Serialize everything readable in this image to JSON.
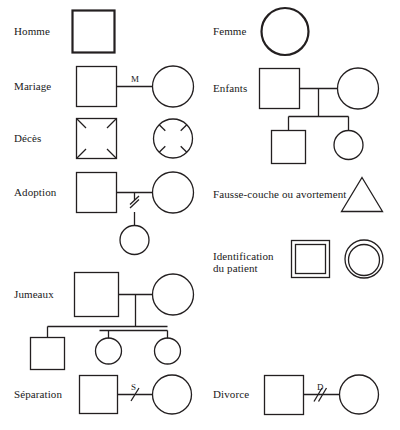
{
  "figure": {
    "kind": "genogram-legend",
    "language": "fr",
    "width": 400,
    "height": 430,
    "background_color": "#ffffff",
    "stroke_color": "#231f20",
    "text_color": "#1a1a1a"
  },
  "left_column": {
    "rows": [
      {
        "id": "homme",
        "label": "Homme",
        "symbols": [
          "square-bold"
        ]
      },
      {
        "id": "mariage",
        "label": "Mariage",
        "symbols": [
          "square",
          "circle"
        ],
        "connector": "horizontal-line",
        "connector_label": "M"
      },
      {
        "id": "deces",
        "label": "Décès",
        "symbols": [
          "square-with-corner-ticks",
          "circle-with-diagonal-ticks"
        ]
      },
      {
        "id": "adoption",
        "label": "Adoption",
        "symbols": [
          "square",
          "circle",
          "circle-child"
        ],
        "connector": "couple-line-with-descent",
        "descent_mark": "double-slash"
      },
      {
        "id": "jumeaux",
        "label": "Jumeaux",
        "symbols": [
          "square-parent",
          "circle-parent",
          "square-child",
          "circle-twin-1",
          "circle-twin-2"
        ],
        "connector": "sibship-line",
        "twin_mark": "double-horizontal-bar"
      },
      {
        "id": "separation",
        "label": "Séparation",
        "symbols": [
          "square",
          "circle"
        ],
        "connector": "horizontal-line-with-single-slash",
        "connector_label": "S"
      }
    ]
  },
  "right_column": {
    "rows": [
      {
        "id": "femme",
        "label": "Femme",
        "symbols": [
          "circle-bold"
        ]
      },
      {
        "id": "enfants",
        "label": "Enfants",
        "symbols": [
          "square-parent",
          "circle-parent",
          "square-child",
          "circle-child"
        ],
        "connector": "couple-line-with-sibship"
      },
      {
        "id": "fausse-couche",
        "label": "Fausse-couche ou avortement",
        "symbols": [
          "triangle"
        ]
      },
      {
        "id": "identification-du-patient",
        "label_line_1": "Identification",
        "label_line_2": "du patient",
        "label": "Identification du patient",
        "symbols": [
          "double-square",
          "double-circle"
        ]
      },
      {
        "id": "divorce",
        "label": "Divorce",
        "symbols": [
          "square",
          "circle"
        ],
        "connector": "horizontal-line-with-double-slash",
        "connector_label": "D"
      }
    ]
  },
  "connector_labels": {
    "mariage": "M",
    "separation": "S",
    "divorce": "D"
  }
}
